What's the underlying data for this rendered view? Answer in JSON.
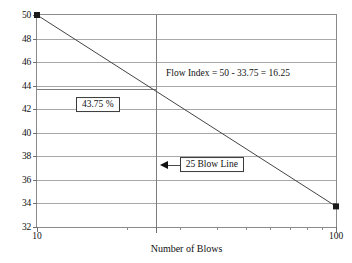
{
  "chart_data": {
    "type": "line",
    "title": "",
    "xlabel": "Number of Blows",
    "ylabel": "Moisture Content in %",
    "xscale": "log",
    "xlim": [
      10,
      100
    ],
    "ylim": [
      32,
      50
    ],
    "grid": true,
    "legend": false,
    "x": [
      10,
      100
    ],
    "values": [
      50,
      33.75
    ],
    "series": [
      {
        "name": "Flow curve",
        "x": [
          10,
          100
        ],
        "values": [
          50,
          33.75
        ],
        "marker": "square",
        "color": "#444444"
      }
    ],
    "y_ticks": [
      32,
      34,
      36,
      38,
      40,
      42,
      44,
      46,
      48,
      50
    ],
    "y_tick_labels": [
      "32",
      "34",
      "36",
      "38",
      "40",
      "42",
      "44",
      "46",
      "48",
      "50"
    ],
    "x_ticks": [
      10,
      100
    ],
    "x_tick_labels": [
      "10",
      "100"
    ],
    "x_minor_ticks": [
      20,
      25,
      30,
      40,
      50,
      60,
      70,
      80,
      90
    ],
    "annotations": [
      {
        "id": "flow-index",
        "text": "Flow Index = 50 - 33.75 = 16.25",
        "boxed": false,
        "x": 27,
        "y": 45.1
      },
      {
        "id": "moisture-value",
        "text": "43.75 %",
        "boxed": true,
        "x": 13.5,
        "y": 42.4
      },
      {
        "id": "blow-line",
        "text": "25 Blow Line",
        "boxed": true,
        "arrow": "left",
        "x": 30,
        "y": 37.3
      }
    ],
    "reference_lines": [
      {
        "id": "blow-25-vertical",
        "orientation": "vertical",
        "x": 25,
        "label": "25 Blow Line"
      },
      {
        "id": "moisture-43-75-horizontal",
        "orientation": "horizontal",
        "y": 43.75,
        "label": "43.75 %"
      }
    ],
    "data_points": [
      {
        "x": 10,
        "y": 50
      },
      {
        "x": 100,
        "y": 33.75
      }
    ],
    "colors": {
      "curve": "#444444",
      "grid": "#a8a8a8",
      "axis": "#8a8a8a",
      "marker": "#1a1a1a",
      "text": "#111111",
      "background": "#ffffff"
    }
  }
}
